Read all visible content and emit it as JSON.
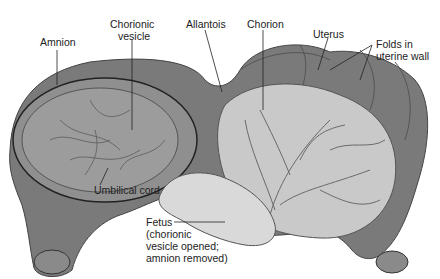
{
  "labels": {
    "amnion": "Amnion",
    "chorionic_vesicle_1": "Chorionic",
    "chorionic_vesicle_2": "vesicle",
    "allantois": "Allantois",
    "chorion": "Chorion",
    "uterus": "Uterus",
    "folds_1": "Folds in",
    "folds_2": "uterine wall",
    "umbilical_cord": "Umbilical cord",
    "fetus_1": "Fetus",
    "fetus_2": "(chorionic",
    "fetus_3": "vesicle opened;",
    "fetus_4": "amnion removed)"
  },
  "colors": {
    "uterus": "#7a7a7a",
    "uterus_dark": "#5e5e5e",
    "chorion": "#c9c9c9",
    "vesicle": "#8f8f8f",
    "vessels": "#6a6a6a",
    "fetus": "#d9d9d9"
  }
}
